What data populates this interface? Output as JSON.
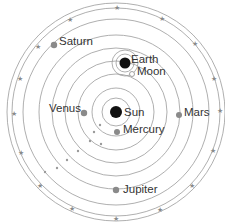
{
  "diagram": {
    "title": "",
    "center": {
      "x": 116,
      "y": 112
    },
    "orbits_radii": [
      14,
      24,
      38,
      51,
      64,
      77,
      93,
      104,
      109
    ],
    "colors": {
      "orbit": "#9a9a9a",
      "planet": "#8a8a8a",
      "sun": "#111111",
      "earth": "#111111",
      "moon": "#ffffff",
      "star": "#8a8a8a",
      "text": "#333333"
    },
    "bodies": [
      {
        "id": "sun",
        "label": "Sun",
        "x": 116,
        "y": 112,
        "r": 6,
        "fill": "#111111"
      },
      {
        "id": "earth",
        "label": "Earth",
        "x": 125,
        "y": 63,
        "r": 5.5,
        "fill": "#111111"
      },
      {
        "id": "moon",
        "label": "Moon",
        "x": 132,
        "y": 74,
        "r": 2.5,
        "fill": "#ffffff"
      },
      {
        "id": "mercury",
        "label": "Mercury",
        "x": 117,
        "y": 132,
        "r": 3,
        "fill": "#8a8a8a"
      },
      {
        "id": "venus",
        "label": "Venus",
        "x": 84,
        "y": 113,
        "r": 3.2,
        "fill": "#8a8a8a"
      },
      {
        "id": "mars",
        "label": "Mars",
        "x": 179,
        "y": 115,
        "r": 3,
        "fill": "#8a8a8a"
      },
      {
        "id": "jupiter",
        "label": "Jupiter",
        "x": 116,
        "y": 190,
        "r": 3.2,
        "fill": "#8a8a8a"
      },
      {
        "id": "saturn",
        "label": "Saturn",
        "x": 54,
        "y": 45,
        "r": 3.2,
        "fill": "#8a8a8a"
      }
    ],
    "labels": [
      {
        "text": "Earth",
        "x": 131,
        "y": 63
      },
      {
        "text": "Moon",
        "x": 137,
        "y": 75
      },
      {
        "text": "Sun",
        "x": 124,
        "y": 116
      },
      {
        "text": "Mercury",
        "x": 123,
        "y": 133
      },
      {
        "text": "Venus",
        "x": 49,
        "y": 112
      },
      {
        "text": "Mars",
        "x": 184,
        "y": 116
      },
      {
        "text": "Jupiter",
        "x": 123,
        "y": 193
      },
      {
        "text": "Saturn",
        "x": 59,
        "y": 45
      }
    ],
    "stars": [
      {
        "x": 117,
        "y": 7
      },
      {
        "x": 162,
        "y": 18
      },
      {
        "x": 195,
        "y": 43
      },
      {
        "x": 214,
        "y": 78
      },
      {
        "x": 220,
        "y": 110
      },
      {
        "x": 213,
        "y": 150
      },
      {
        "x": 192,
        "y": 185
      },
      {
        "x": 160,
        "y": 209
      },
      {
        "x": 116,
        "y": 218
      },
      {
        "x": 72,
        "y": 208
      },
      {
        "x": 40,
        "y": 185
      },
      {
        "x": 21,
        "y": 152
      },
      {
        "x": 14,
        "y": 113
      },
      {
        "x": 20,
        "y": 78
      },
      {
        "x": 38,
        "y": 46
      },
      {
        "x": 70,
        "y": 19
      }
    ],
    "small_dots": [
      {
        "x": 100,
        "y": 125
      },
      {
        "x": 94,
        "y": 132
      },
      {
        "x": 90,
        "y": 141
      },
      {
        "x": 78,
        "y": 151
      },
      {
        "x": 67,
        "y": 160
      },
      {
        "x": 57,
        "y": 168
      },
      {
        "x": 45,
        "y": 172
      },
      {
        "x": 101,
        "y": 144
      }
    ]
  }
}
